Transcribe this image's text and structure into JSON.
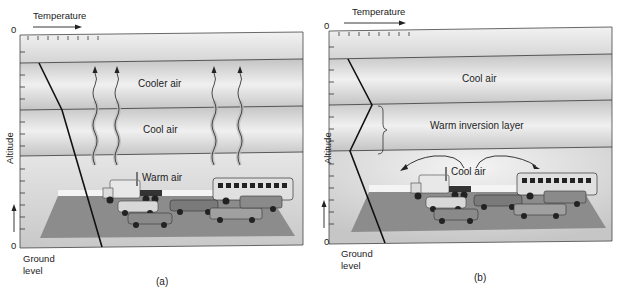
{
  "figure": {
    "panels": [
      {
        "id": "a",
        "caption": "(a)",
        "x_axis_label": "Temperature",
        "y_axis_label": "Altitude",
        "x_origin": "0",
        "y_origin": "0",
        "ground_label_line1": "Ground",
        "ground_label_line2": "level",
        "layers": [
          "Cooler air",
          "Cool air",
          "Warm air"
        ],
        "description": "Normal conditions: temperature decreases with altitude; warm polluted air rises and disperses"
      },
      {
        "id": "b",
        "caption": "(b)",
        "x_axis_label": "Temperature",
        "y_axis_label": "Altitude",
        "x_origin": "0",
        "y_origin": "0",
        "ground_label_line1": "Ground",
        "ground_label_line2": "level",
        "layers": [
          "Cool air",
          "Warm inversion layer",
          "Cool air"
        ],
        "description": "Temperature inversion: warm layer traps cool polluted air near the ground"
      }
    ],
    "colors": {
      "band_dark": "#bdbdbd",
      "band_light": "#ececec",
      "ground": "#8a8a8a",
      "line": "#111111"
    }
  }
}
